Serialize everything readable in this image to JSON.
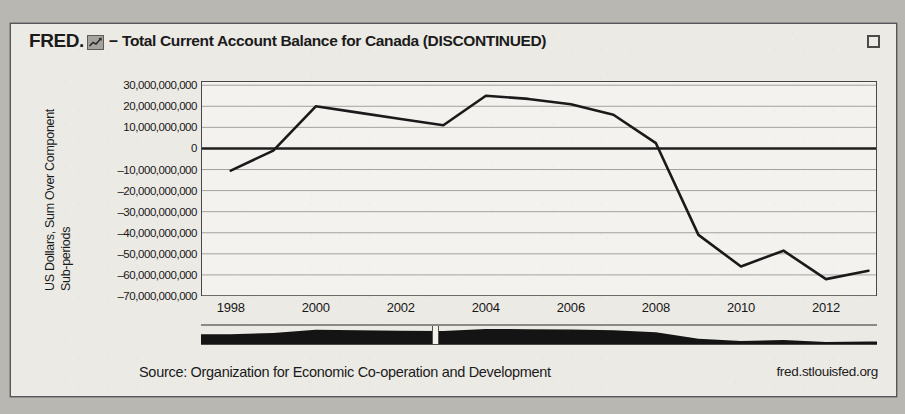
{
  "header": {
    "brand": "FRED.",
    "logo_icon": "fred-mini-chart-icon",
    "dash": "–",
    "title": "Total Current Account Balance for Canada (DISCONTINUED)",
    "expand_icon": "expand-fullscreen-icon"
  },
  "footer": {
    "source": "Source: Organization for Economic Co-operation and Development",
    "url": "fred.stlouisfed.org"
  },
  "navigator": {
    "handle_position_fraction": 0.345
  },
  "colors": {
    "paper": "#eceae5",
    "line": "#1a1a1a",
    "grid": "#9a9894",
    "axis": "#4a4846",
    "navigator_fill": "#141414",
    "text": "#1b1b1b"
  },
  "chart_data": {
    "type": "line",
    "title": "Total Current Account Balance for Canada (DISCONTINUED)",
    "xlabel": "",
    "ylabel": "US Dollars, Sum Over Component Sub-periods",
    "ylabel_line1": "US Dollars, Sum Over Component",
    "ylabel_line2": "Sub-periods",
    "grid": true,
    "legend": "none",
    "xlim": [
      1997.3,
      1013.2
    ],
    "ylim": [
      -70000000000,
      32000000000
    ],
    "xticks": [
      1998,
      2000,
      2002,
      2004,
      2006,
      2008,
      2010,
      2012
    ],
    "xtick_labels": [
      "1998",
      "2000",
      "2002",
      "2004",
      "2006",
      "2008",
      "2010",
      "2012"
    ],
    "yticks": [
      30000000000,
      20000000000,
      10000000000,
      0,
      -10000000000,
      -20000000000,
      -30000000000,
      -40000000000,
      -50000000000,
      -60000000000,
      -70000000000
    ],
    "ytick_labels": [
      "30,000,000,000",
      "20,000,000,000",
      "10,000,000,000",
      "0",
      "–10,000,000,000",
      "–20,000,000,000",
      "–30,000,000,000",
      "–40,000,000,000",
      "–50,000,000,000",
      "–60,000,000,000",
      "–70,000,000,000"
    ],
    "series": [
      {
        "name": "Total Current Account Balance for Canada",
        "x": [
          1998,
          1999,
          2000,
          2001,
          2002,
          2003,
          2004,
          2005,
          2006,
          2007,
          2008,
          2009,
          2010,
          2011,
          2012,
          2013
        ],
        "values": [
          -10500000000,
          -1000000000,
          20000000000,
          17000000000,
          14000000000,
          11000000000,
          25000000000,
          23500000000,
          21000000000,
          16000000000,
          2500000000,
          -41000000000,
          -56000000000,
          -48500000000,
          -62000000000,
          -58000000000
        ]
      }
    ],
    "navigator_series": {
      "name": "range-selector-overview",
      "x": [
        1998,
        1999,
        2000,
        2001,
        2002,
        2003,
        2004,
        2005,
        2006,
        2007,
        2008,
        2009,
        2010,
        2011,
        2012,
        2013
      ],
      "values": [
        -10500000000,
        -1000000000,
        20000000000,
        17000000000,
        14000000000,
        11000000000,
        25000000000,
        23500000000,
        21000000000,
        16000000000,
        2500000000,
        -41000000000,
        -56000000000,
        -48500000000,
        -62000000000,
        -58000000000
      ]
    }
  }
}
